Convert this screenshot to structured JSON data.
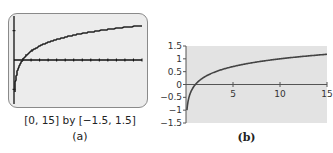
{
  "panels": {
    "a": {
      "label": "(a)",
      "window_text": "[0, 15] by [−1.5, 1.5]"
    },
    "b": {
      "label": "(b)"
    }
  },
  "colors": {
    "calc_background": "#ececec",
    "calc_border": "#8a8a8a",
    "plot_background": "#e3e3e3",
    "curve": "#444444",
    "axis": "#555555"
  },
  "chart_data": [
    {
      "type": "line",
      "title": "",
      "subtitle": "Graphing calculator view",
      "caption": "[0, 15] by [−1.5, 1.5]",
      "panel": "(a)",
      "function": "y = log10(x)",
      "xlim": [
        0,
        15
      ],
      "ylim": [
        -1.5,
        1.5
      ],
      "x_tick_step": 1,
      "y_tick_step": 1,
      "grid": false,
      "series": [
        {
          "name": "log10(x)",
          "x": [
            0.1,
            0.2,
            0.5,
            1,
            2,
            3,
            4,
            5,
            6,
            7,
            8,
            9,
            10,
            11,
            12,
            13,
            14,
            15
          ],
          "values": [
            -1,
            -0.7,
            -0.3,
            0,
            0.3,
            0.48,
            0.6,
            0.7,
            0.78,
            0.85,
            0.9,
            0.95,
            1,
            1.04,
            1.08,
            1.11,
            1.15,
            1.18
          ]
        }
      ]
    },
    {
      "type": "line",
      "title": "",
      "panel": "(b)",
      "function": "y = log10(x)",
      "xlabel": "",
      "ylabel": "",
      "xlim": [
        0,
        15
      ],
      "ylim": [
        -1.5,
        1.5
      ],
      "x_ticks": [
        5,
        10,
        15
      ],
      "y_ticks": [
        1.5,
        1,
        0.5,
        0,
        -0.5,
        -1,
        -1.5
      ],
      "x_tick_labels": [
        "5",
        "10",
        "15"
      ],
      "y_tick_labels": [
        "1.5",
        "1",
        "0.5",
        "0",
        "−0.5",
        "−1",
        "−1.5"
      ],
      "grid": false,
      "series": [
        {
          "name": "log10(x)",
          "x": [
            0.1,
            0.2,
            0.5,
            1,
            2,
            3,
            4,
            5,
            6,
            7,
            8,
            9,
            10,
            11,
            12,
            13,
            14,
            15
          ],
          "values": [
            -1,
            -0.7,
            -0.3,
            0,
            0.3,
            0.48,
            0.6,
            0.7,
            0.78,
            0.85,
            0.9,
            0.95,
            1,
            1.04,
            1.08,
            1.11,
            1.15,
            1.18
          ]
        }
      ]
    }
  ]
}
